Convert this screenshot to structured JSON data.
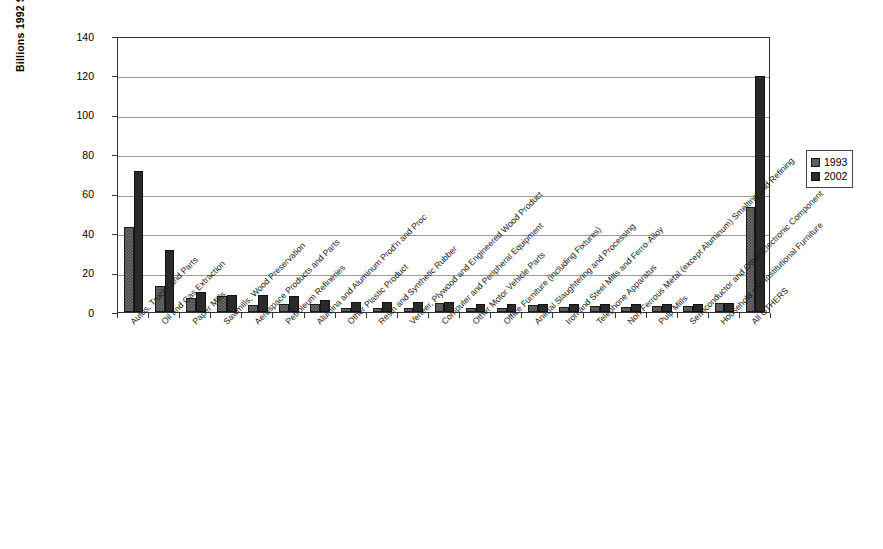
{
  "chart_data": {
    "type": "bar",
    "title": "",
    "xlabel": "",
    "ylabel": "Billions 1992 $ CDN",
    "ylim": [
      0,
      140
    ],
    "yticks": [
      0,
      20,
      40,
      60,
      80,
      100,
      120,
      140
    ],
    "grid": true,
    "legend_position": "right",
    "colors": {
      "1993": "#6e6e6e",
      "2002": "#2a2a2a"
    },
    "categories": [
      "Autos, Trucks and Parts",
      "Oil and Gas Extraction",
      "Paper Mills",
      "Sawmills, Wood Preservation",
      "Aerospace Products and Parts",
      "Petroleum Refineries",
      "Alumina and Aluminum Prod'n and Proc",
      "Other Plastic Product",
      "Resin and Synthetic Rubber",
      "Veneer, Plywood and Engineered Wood Product",
      "Computer and Peripheral Equipment",
      "Other Motor Vehicle Parts",
      "Office Furniture (including Fixtures)",
      "Animal Slaughtering and Processing",
      "Iron and Steel Mills and Ferro-Alloy",
      "Telephone Apparatus",
      "Non-Ferrous Metal (except Aluminum) Smelting and Refining",
      "Pulp Mills",
      "Semiconductor and Other Electronic Component",
      "Household and Institutional Furniture",
      "All OTHERS"
    ],
    "series": [
      {
        "name": "1993",
        "values": [
          43,
          13,
          7,
          8,
          3.5,
          4,
          4,
          2,
          2,
          2,
          4.5,
          2,
          2,
          3.5,
          2.5,
          3,
          2.5,
          3,
          3,
          4.5,
          53.5
        ]
      },
      {
        "name": "2002",
        "values": [
          71.5,
          31.5,
          10,
          8.5,
          8.5,
          8,
          6,
          5,
          5,
          5,
          5,
          4,
          4,
          4,
          4,
          4,
          4,
          4,
          4,
          4.5,
          119.5
        ]
      }
    ]
  },
  "legend": {
    "items": [
      {
        "label": "1993"
      },
      {
        "label": "2002"
      }
    ]
  }
}
